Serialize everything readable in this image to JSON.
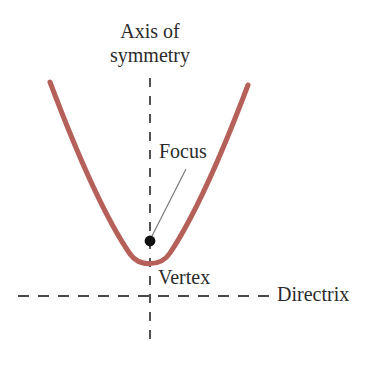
{
  "figure": {
    "title_label": "Axis of\nsymmetry",
    "background_color": "#ffffff",
    "curve_color": "#b5615a",
    "line_color": "#4a4a4a",
    "text_color": "#2b2b2b",
    "labels": {
      "axis_of_symmetry_line1": "Axis of",
      "axis_of_symmetry_line2": "symmetry",
      "focus": "Focus",
      "vertex": "Vertex",
      "directrix": "Directrix"
    },
    "elements": {
      "parabola": {
        "name": "parabola-curve",
        "vertex": [
          150,
          266
        ],
        "left_end": [
          50,
          82
        ],
        "right_end": [
          248,
          85
        ],
        "stroke_width": 5,
        "color": "#b5615a"
      },
      "axis_of_symmetry": {
        "name": "axis-of-symmetry-line",
        "orientation": "vertical",
        "x": 150,
        "y_start": 78,
        "y_end": 348,
        "style": "dashed"
      },
      "directrix": {
        "name": "directrix-line",
        "orientation": "horizontal",
        "y": 296,
        "x_start": 18,
        "x_end": 272,
        "style": "dashed"
      },
      "focus_point": {
        "name": "focus-point",
        "x": 150,
        "y": 241,
        "radius": 5,
        "color": "#111111"
      },
      "focus_leader": {
        "name": "focus-leader-line",
        "from": [
          186,
          169
        ],
        "to": [
          152,
          237
        ],
        "color": "#7a7a7a"
      }
    }
  }
}
